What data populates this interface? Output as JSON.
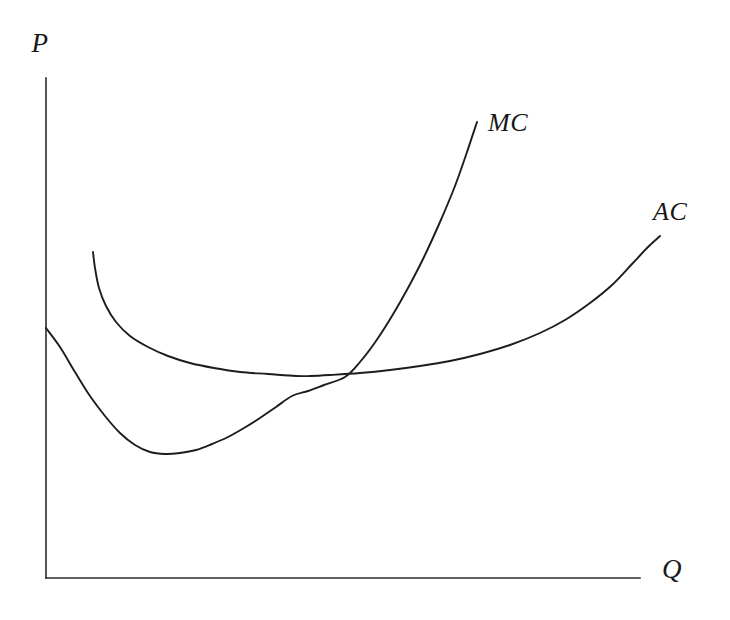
{
  "figure": {
    "background_color": "#ffffff",
    "line_color": "#1d1d1d",
    "axis_color": "#2b2b2b",
    "width": 730,
    "height": 620
  },
  "axes": {
    "y_axis_label": "P",
    "x_axis_label": "Q"
  },
  "labels": {
    "mc_label": "MC",
    "ac_label": "AC"
  },
  "chart_data": {
    "type": "line",
    "title": "",
    "xlabel": "Q",
    "ylabel": "P",
    "grid": false,
    "legend_position": "inline-end-of-curve",
    "axis_origin_px": [
      46,
      578
    ],
    "x_axis_end_px": [
      640,
      578
    ],
    "y_axis_top_px": [
      46,
      78
    ],
    "xlim": [
      0,
      100
    ],
    "ylim": [
      0,
      100
    ],
    "annotations": [
      {
        "text": "MC",
        "x_px": 488,
        "y_px": 130,
        "describes": "marginal-cost-curve"
      },
      {
        "text": "AC",
        "x_px": 653,
        "y_px": 218,
        "describes": "average-cost-curve"
      }
    ],
    "intersection": {
      "label": "MC crosses AC at AC minimum",
      "x_px": 345,
      "y_px": 377
    },
    "series": [
      {
        "name": "MC",
        "description": "Marginal cost curve: falls from the vertical axis to a minimum then rises steeply",
        "minimum_px": [
          150,
          452
        ],
        "start_px": [
          46,
          328
        ],
        "end_px": [
          477,
          122
        ],
        "points_px": [
          [
            46,
            328
          ],
          [
            60,
            347
          ],
          [
            75,
            372
          ],
          [
            90,
            396
          ],
          [
            105,
            416
          ],
          [
            120,
            433
          ],
          [
            135,
            445
          ],
          [
            150,
            452
          ],
          [
            165,
            454
          ],
          [
            180,
            453
          ],
          [
            196,
            450
          ],
          [
            212,
            444
          ],
          [
            228,
            437
          ],
          [
            244,
            428
          ],
          [
            260,
            418
          ],
          [
            276,
            407
          ],
          [
            292,
            396
          ],
          [
            308,
            391
          ],
          [
            324,
            385
          ],
          [
            345,
            377
          ],
          [
            360,
            362
          ],
          [
            376,
            341
          ],
          [
            392,
            316
          ],
          [
            408,
            288
          ],
          [
            424,
            257
          ],
          [
            440,
            222
          ],
          [
            455,
            186
          ],
          [
            466,
            155
          ],
          [
            477,
            122
          ]
        ]
      },
      {
        "name": "AC",
        "description": "Average cost curve: drops steeply from a high left starting point, flattens through a shallow minimum, then rises gradually",
        "minimum_px": [
          310,
          376
        ],
        "start_px": [
          93,
          252
        ],
        "end_px": [
          660,
          236
        ],
        "points_px": [
          [
            93,
            252
          ],
          [
            95,
            268
          ],
          [
            99,
            288
          ],
          [
            106,
            306
          ],
          [
            116,
            322
          ],
          [
            130,
            336
          ],
          [
            148,
            347
          ],
          [
            168,
            356
          ],
          [
            190,
            363
          ],
          [
            214,
            368
          ],
          [
            240,
            372
          ],
          [
            268,
            374
          ],
          [
            296,
            376
          ],
          [
            310,
            376
          ],
          [
            330,
            375
          ],
          [
            360,
            373
          ],
          [
            390,
            370
          ],
          [
            420,
            366
          ],
          [
            450,
            361
          ],
          [
            480,
            354
          ],
          [
            510,
            345
          ],
          [
            540,
            333
          ],
          [
            565,
            320
          ],
          [
            590,
            303
          ],
          [
            612,
            285
          ],
          [
            632,
            264
          ],
          [
            648,
            247
          ],
          [
            660,
            236
          ]
        ]
      }
    ]
  }
}
